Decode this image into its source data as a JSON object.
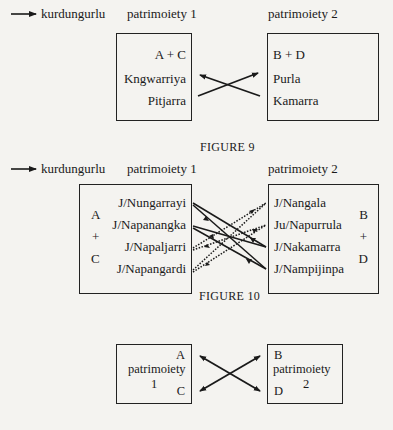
{
  "legend": {
    "arrow_label": "kurdungurlu"
  },
  "figure9": {
    "caption": "FIGURE 9",
    "headers": [
      "patrimoiety 1",
      "patrimoiety 2"
    ],
    "left_box": {
      "title": "A + C",
      "items": [
        "Kngwarriya",
        "Pitjarra"
      ]
    },
    "right_box": {
      "title": "B + D",
      "items": [
        "Purla",
        "Kamarra"
      ]
    }
  },
  "figure10": {
    "caption": "FIGURE 10",
    "headers": [
      "patrimoiety 1",
      "patrimoiety 2"
    ],
    "left_box": {
      "side_labels": [
        "A",
        "+",
        "C"
      ],
      "items": [
        "J/Nungarrayi",
        "J/Napanangka",
        "J/Napaljarri",
        "J/Napangardi"
      ]
    },
    "right_box": {
      "side_labels": [
        "B",
        "+",
        "D"
      ],
      "items": [
        "J/Nangala",
        "Ju/Napurrula",
        "J/Nakamarra",
        "J/Nampijinpa"
      ]
    }
  },
  "figure11": {
    "left_box": {
      "top": "A",
      "label_line1": "patrimoiety",
      "label_line2": "1",
      "bottom": "C"
    },
    "right_box": {
      "top": "B",
      "label_line1": "patrimoiety",
      "label_line2": "2",
      "bottom": "D"
    }
  }
}
